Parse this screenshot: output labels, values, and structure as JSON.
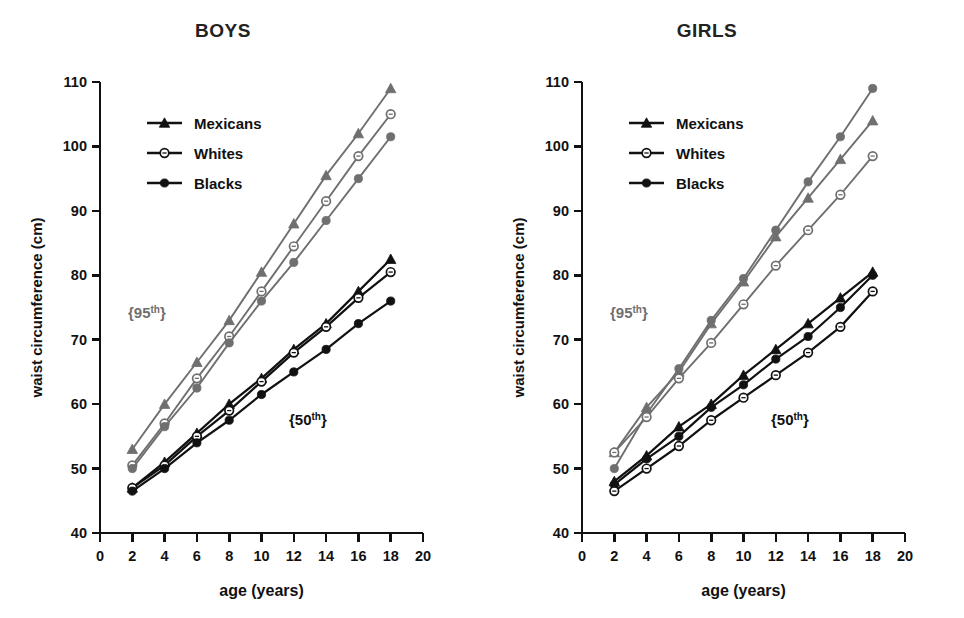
{
  "figure": {
    "background": "#ffffff",
    "panels": [
      "BOYS",
      "GIRLS"
    ]
  },
  "axis": {
    "y_label": "waist circumference (cm)",
    "x_label": "age (years)",
    "y_ticks": [
      "40",
      "50",
      "60",
      "70",
      "80",
      "90",
      "100",
      "110"
    ],
    "x_ticks": [
      "0",
      "2",
      "4",
      "6",
      "8",
      "10",
      "12",
      "14",
      "16",
      "18",
      "20"
    ]
  },
  "legend": {
    "items": [
      {
        "label": "Mexicans",
        "marker": "triangle"
      },
      {
        "label": "Whites",
        "marker": "open-circle"
      },
      {
        "label": "Blacks",
        "marker": "filled-circle"
      }
    ]
  },
  "annotations": {
    "p95": "{95",
    "p95_sup": "th",
    "p95_close": "}",
    "p50": "{50",
    "p50_sup": "th",
    "p50_close": "}"
  },
  "colors": {
    "percentile_95": "#6f6f6f",
    "percentile_50": "#111111",
    "axis": "#111111",
    "background": "#ffffff"
  },
  "chart_data": {
    "type": "line",
    "xlabel": "age (years)",
    "ylabel": "waist circumference (cm)",
    "xlim": [
      0,
      20
    ],
    "ylim": [
      40,
      110
    ],
    "xticks": [
      0,
      2,
      4,
      6,
      8,
      10,
      12,
      14,
      16,
      18,
      20
    ],
    "yticks": [
      40,
      50,
      60,
      70,
      80,
      90,
      100,
      110
    ],
    "grid": false,
    "legend_position": "upper-left-inside",
    "x": [
      2,
      4,
      6,
      8,
      10,
      12,
      14,
      16,
      18
    ],
    "panels": [
      {
        "name": "BOYS",
        "series": [
          {
            "name": "Mexicans",
            "percentile": "95th",
            "marker": "triangle",
            "color": "#6f6f6f",
            "values": [
              53.0,
              60.0,
              66.5,
              73.0,
              80.5,
              88.0,
              95.5,
              102.0,
              109.0
            ]
          },
          {
            "name": "Whites",
            "percentile": "95th",
            "marker": "open-circle",
            "color": "#6f6f6f",
            "values": [
              50.5,
              57.0,
              64.0,
              70.5,
              77.5,
              84.5,
              91.5,
              98.5,
              105.0
            ]
          },
          {
            "name": "Blacks",
            "percentile": "95th",
            "marker": "filled-circle",
            "color": "#6f6f6f",
            "values": [
              50.0,
              56.5,
              62.5,
              69.5,
              76.0,
              82.0,
              88.5,
              95.0,
              101.5
            ]
          },
          {
            "name": "Mexicans",
            "percentile": "50th",
            "marker": "triangle",
            "color": "#111111",
            "values": [
              47.0,
              51.0,
              55.5,
              60.0,
              64.0,
              68.5,
              72.5,
              77.5,
              82.5
            ]
          },
          {
            "name": "Whites",
            "percentile": "50th",
            "marker": "open-circle",
            "color": "#111111",
            "values": [
              47.0,
              50.5,
              55.0,
              59.0,
              63.5,
              68.0,
              72.0,
              76.5,
              80.5
            ]
          },
          {
            "name": "Blacks",
            "percentile": "50th",
            "marker": "filled-circle",
            "color": "#111111",
            "values": [
              46.5,
              50.0,
              54.0,
              57.5,
              61.5,
              65.0,
              68.5,
              72.5,
              76.0
            ]
          }
        ]
      },
      {
        "name": "GIRLS",
        "series": [
          {
            "name": "Blacks",
            "percentile": "95th",
            "marker": "filled-circle",
            "color": "#6f6f6f",
            "values": [
              50.0,
              58.5,
              65.5,
              73.0,
              79.5,
              87.0,
              94.5,
              101.5,
              109.0
            ]
          },
          {
            "name": "Mexicans",
            "percentile": "95th",
            "marker": "triangle",
            "color": "#6f6f6f",
            "values": [
              52.5,
              59.5,
              65.0,
              72.5,
              79.0,
              86.0,
              92.0,
              98.0,
              104.0
            ]
          },
          {
            "name": "Whites",
            "percentile": "95th",
            "marker": "open-circle",
            "color": "#6f6f6f",
            "values": [
              52.5,
              58.0,
              64.0,
              69.5,
              75.5,
              81.5,
              87.0,
              92.5,
              98.5
            ]
          },
          {
            "name": "Mexicans",
            "percentile": "50th",
            "marker": "triangle",
            "color": "#111111",
            "values": [
              48.0,
              52.0,
              56.5,
              60.0,
              64.5,
              68.5,
              72.5,
              76.5,
              80.5
            ]
          },
          {
            "name": "Blacks",
            "percentile": "50th",
            "marker": "filled-circle",
            "color": "#111111",
            "values": [
              47.5,
              51.5,
              55.0,
              59.5,
              63.0,
              67.0,
              70.5,
              75.0,
              80.0
            ]
          },
          {
            "name": "Whites",
            "percentile": "50th",
            "marker": "open-circle",
            "color": "#111111",
            "values": [
              46.5,
              50.0,
              53.5,
              57.5,
              61.0,
              64.5,
              68.0,
              72.0,
              77.5
            ]
          }
        ]
      }
    ]
  }
}
